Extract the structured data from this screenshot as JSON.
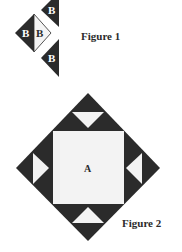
{
  "figure1": {
    "caption": "Figure 1",
    "pieces": [
      {
        "id": "top-triangle",
        "label": "B",
        "shade": "dark"
      },
      {
        "id": "diamond-left-half",
        "label": "B",
        "shade": "dark"
      },
      {
        "id": "diamond-right-half",
        "label": "B",
        "shade": "light"
      },
      {
        "id": "bottom-triangle",
        "label": "B",
        "shade": "dark"
      }
    ]
  },
  "figure2": {
    "caption": "Figure 2",
    "center_label": "A"
  },
  "colors": {
    "dark": "#2b2b2b",
    "light": "#f3f3f3",
    "background": "#ffffff"
  }
}
